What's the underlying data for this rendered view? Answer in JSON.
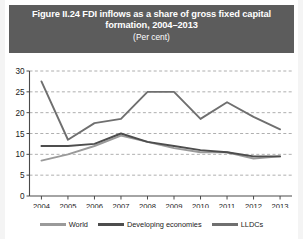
{
  "figure": {
    "title_main": "Figure II.24 FDI inflows as a share of gross fixed capital formation, 2004–2013",
    "title_sub": "(Per cent)",
    "banner_color": "#5c5c5c"
  },
  "chart_data": {
    "type": "line",
    "title": "Figure II.24 FDI inflows as a share of gross fixed capital formation, 2004–2013",
    "subtitle": "(Per cent)",
    "xlabel": "",
    "ylabel": "",
    "unit": "Per cent",
    "grid": true,
    "legend_position": "bottom",
    "ylim": [
      0,
      30
    ],
    "yticks": [
      0,
      5,
      10,
      15,
      20,
      25,
      30
    ],
    "ytick_labels": [
      "0",
      "5",
      "10",
      "15",
      "20",
      "25",
      "30"
    ],
    "categories": [
      "2004",
      "2005",
      "2006",
      "2007",
      "2008",
      "2009",
      "2010",
      "2011",
      "2012",
      "2013"
    ],
    "series": [
      {
        "name": "World",
        "color": "#9a9a9a",
        "values": [
          8.5,
          10.0,
          12.0,
          14.5,
          13.0,
          11.5,
          10.5,
          10.5,
          9.0,
          9.5
        ]
      },
      {
        "name": "Developing economies",
        "color": "#4d4d4d",
        "values": [
          12.0,
          12.0,
          12.5,
          15.0,
          13.0,
          12.0,
          11.0,
          10.5,
          9.5,
          9.5
        ]
      },
      {
        "name": "LLDCs",
        "color": "#6f6f6f",
        "values": [
          27.5,
          13.5,
          17.5,
          18.5,
          25.0,
          25.0,
          18.5,
          22.5,
          19.0,
          16.0
        ]
      }
    ]
  },
  "axis": {
    "ytick_labels": [
      "30",
      "25",
      "20",
      "15",
      "10",
      "5",
      "0"
    ],
    "xtick_labels": [
      "2004",
      "2005",
      "2006",
      "2007",
      "2008",
      "2009",
      "2010",
      "2011",
      "2012",
      "2013"
    ]
  },
  "legend": {
    "items": [
      {
        "label": "World",
        "color": "#9a9a9a"
      },
      {
        "label": "Developing economies",
        "color": "#4d4d4d"
      },
      {
        "label": "LLDCs",
        "color": "#6f6f6f"
      }
    ]
  }
}
